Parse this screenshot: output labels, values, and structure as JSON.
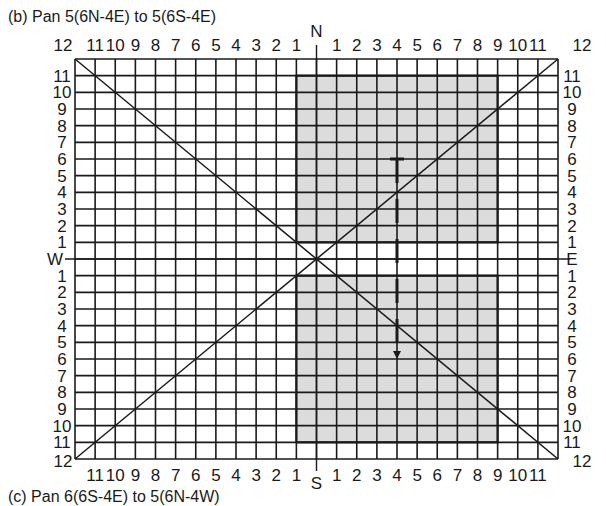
{
  "figure": {
    "caption_top": "(b)  Pan 5(6N-4E) to 5(6S-4E)",
    "caption_bottom": "(c)  Pan 6(6S-4E) to 5(6N-4W)",
    "compass": {
      "north": "N",
      "south": "S",
      "west": "W",
      "east": "E"
    },
    "grid": {
      "columns_per_side": 12,
      "rows_per_side": 12,
      "corner_label": "12",
      "horizontal_labels_west": [
        "11",
        "10",
        "9",
        "8",
        "7",
        "6",
        "5",
        "4",
        "3",
        "2",
        "1"
      ],
      "horizontal_labels_east": [
        "1",
        "2",
        "3",
        "4",
        "5",
        "6",
        "7",
        "8",
        "9",
        "10",
        "11"
      ],
      "vertical_labels_north": [
        "11",
        "10",
        "9",
        "8",
        "7",
        "6",
        "5",
        "4",
        "3",
        "2",
        "1"
      ],
      "vertical_labels_south": [
        "1",
        "2",
        "3",
        "4",
        "5",
        "6",
        "7",
        "8",
        "9",
        "10",
        "11"
      ]
    },
    "shaded_regions": [
      {
        "name": "upper-field",
        "from_col": "W1",
        "to_col": "E9",
        "from_row": "N11",
        "to_row": "N1"
      },
      {
        "name": "lower-field",
        "from_col": "W1",
        "to_col": "E9",
        "from_row": "S1",
        "to_row": "S11"
      }
    ],
    "pan_path": {
      "column": "E4",
      "start_row": "N6",
      "end_row": "S6",
      "direction": "south"
    },
    "colors": {
      "grid_line": "#1a1a1a",
      "shade": "#dcdcdc",
      "background": "#ffffff"
    }
  }
}
